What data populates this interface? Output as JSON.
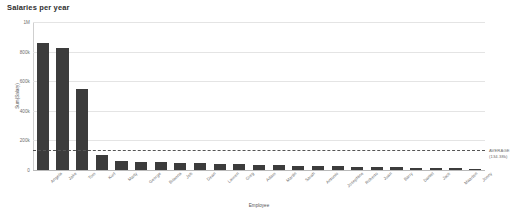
{
  "chart_data": {
    "type": "bar",
    "title": "Salaries per year",
    "xlabel": "Employee",
    "ylabel": "Sum(Salary)",
    "ylim": [
      0,
      1000000
    ],
    "grid": true,
    "legend": "none",
    "ytick_labels": [
      "1M",
      "800k",
      "600k",
      "400k",
      "200k",
      "0"
    ],
    "ytick_values": [
      1000000,
      800000,
      600000,
      400000,
      200000,
      0
    ],
    "categories": [
      "Angela",
      "Jake",
      "Tom",
      "Kurt",
      "Marty",
      "George",
      "Brianna",
      "Jeb",
      "Dean",
      "Lauren",
      "Greg",
      "Adam",
      "Martin",
      "Sarah",
      "Antonio",
      "Josephine",
      "Roberto",
      "Juan",
      "Barry",
      "Daniel",
      "Jack",
      "Maarten",
      "Jonny"
    ],
    "values": [
      855000,
      822000,
      545000,
      100000,
      62000,
      57000,
      53000,
      49000,
      45000,
      41000,
      38000,
      35000,
      32000,
      29000,
      26000,
      24000,
      22000,
      20000,
      18000,
      16000,
      14000,
      12000,
      10000
    ],
    "bar_color": "#3c3c3c",
    "annotations": [
      {
        "name": "average-reference-line",
        "label": "AVERAGE",
        "value_label": "(134.38k)",
        "value": 134380,
        "style": "dashed",
        "color": "#555555"
      }
    ]
  }
}
